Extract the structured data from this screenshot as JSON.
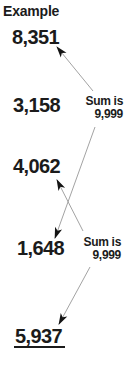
{
  "title": "Example",
  "numbers": [
    {
      "value": "8,351",
      "underlined": false
    },
    {
      "value": "3,158",
      "underlined": false
    },
    {
      "value": "4,062",
      "underlined": false
    },
    {
      "value": "1,648",
      "underlined": false
    },
    {
      "value": "5,937",
      "underlined": true
    }
  ],
  "sum_labels": [
    {
      "line1": "Sum is",
      "line2": "9,999"
    },
    {
      "line1": "Sum is",
      "line2": "9,999"
    }
  ],
  "arrows": [
    {
      "from": "sum-label-1",
      "to": "8,351",
      "x1": 93,
      "y1": 91,
      "x2": 57,
      "y2": 47
    },
    {
      "from": "sum-label-1",
      "to": "1,648",
      "x1": 95,
      "y1": 127,
      "x2": 55,
      "y2": 238
    },
    {
      "from": "sum-label-2",
      "to": "4,062",
      "x1": 83,
      "y1": 231,
      "x2": 57,
      "y2": 180
    },
    {
      "from": "sum-label-2",
      "to": "5,937",
      "x1": 90,
      "y1": 267,
      "x2": 59,
      "y2": 324
    }
  ],
  "colors": {
    "background": "#ffffff",
    "text": "#1b1b1b",
    "arrow_line": "#a3a3a3",
    "arrow_head": "#141414"
  }
}
